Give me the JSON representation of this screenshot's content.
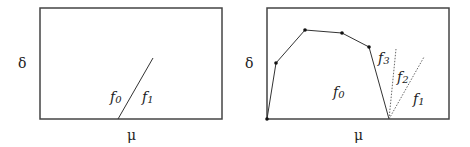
{
  "diagrams": [
    {
      "name": "left-panel",
      "y_label": "δ",
      "x_label": "μ",
      "regions": [
        {
          "base": "f",
          "sub": "0"
        },
        {
          "base": "f",
          "sub": "1"
        }
      ]
    },
    {
      "name": "right-panel",
      "y_label": "δ",
      "x_label": "μ",
      "regions": [
        {
          "base": "f",
          "sub": "0"
        },
        {
          "base": "f",
          "sub": "1"
        },
        {
          "base": "f",
          "sub": "2"
        },
        {
          "base": "f",
          "sub": "3"
        }
      ]
    }
  ],
  "colors": {
    "stroke": "#333333",
    "frame": "#444444"
  }
}
